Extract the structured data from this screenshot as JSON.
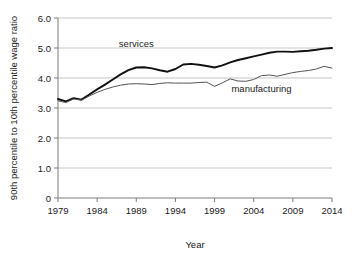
{
  "chart_data": {
    "type": "line",
    "title": "",
    "xlabel": "Year",
    "ylabel": "90th percentile to 10th percentile wage ratio",
    "xlim": [
      1979,
      2014
    ],
    "ylim": [
      0,
      6.0
    ],
    "grid": true,
    "legend_position": "inline-annotation",
    "x_ticks": [
      "1979",
      "1984",
      "1989",
      "1994",
      "1999",
      "2004",
      "2009",
      "2014"
    ],
    "x_tick_values": [
      1979,
      1984,
      1989,
      1994,
      1999,
      2004,
      2009,
      2014
    ],
    "y_ticks": [
      "0",
      "1.0",
      "2.0",
      "3.0",
      "4.0",
      "5.0",
      "6.0"
    ],
    "y_tick_values": [
      0,
      1.0,
      2.0,
      3.0,
      4.0,
      5.0,
      6.0
    ],
    "x": [
      1979,
      1980,
      1981,
      1982,
      1983,
      1984,
      1985,
      1986,
      1987,
      1988,
      1989,
      1990,
      1991,
      1992,
      1993,
      1994,
      1995,
      1996,
      1997,
      1998,
      1999,
      2000,
      2001,
      2002,
      2003,
      2004,
      2005,
      2006,
      2007,
      2008,
      2009,
      2010,
      2011,
      2012,
      2013,
      2014
    ],
    "series": [
      {
        "name": "services",
        "color": "#111111",
        "width": 1.9,
        "values": [
          3.3,
          3.22,
          3.33,
          3.28,
          3.45,
          3.62,
          3.78,
          3.95,
          4.12,
          4.26,
          4.35,
          4.36,
          4.32,
          4.26,
          4.21,
          4.3,
          4.45,
          4.47,
          4.44,
          4.4,
          4.35,
          4.42,
          4.52,
          4.6,
          4.66,
          4.72,
          4.78,
          4.84,
          4.88,
          4.88,
          4.87,
          4.89,
          4.91,
          4.94,
          4.98,
          5.0
        ]
      },
      {
        "name": "manufacturing",
        "color": "#555555",
        "width": 1.0,
        "values": [
          3.24,
          3.18,
          3.3,
          3.26,
          3.4,
          3.52,
          3.62,
          3.7,
          3.76,
          3.8,
          3.81,
          3.8,
          3.78,
          3.82,
          3.84,
          3.83,
          3.83,
          3.83,
          3.85,
          3.86,
          3.72,
          3.84,
          3.97,
          3.9,
          3.89,
          3.95,
          4.08,
          4.1,
          4.06,
          4.12,
          4.18,
          4.22,
          4.25,
          4.3,
          4.39,
          4.33
        ]
      }
    ],
    "annotations": [
      {
        "text": "services",
        "x": 1989,
        "y": 5.05
      },
      {
        "text": "manufacturing",
        "x": 2005,
        "y": 3.55
      }
    ]
  }
}
